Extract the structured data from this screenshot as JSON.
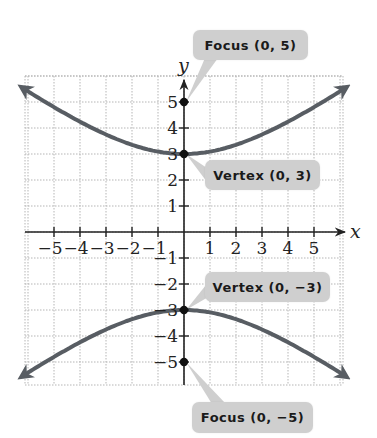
{
  "chart_data": {
    "type": "line",
    "title": "",
    "xlabel": "x",
    "ylabel": "y",
    "xlim": [
      -6.2,
      6.2
    ],
    "ylim": [
      -6,
      6
    ],
    "grid": true,
    "equation": "y^2/9 - x^2/16 = 1",
    "x_ticks": [
      -5,
      -4,
      -3,
      -2,
      -1,
      1,
      2,
      3,
      4,
      5
    ],
    "y_ticks": [
      -5,
      -4,
      -3,
      -2,
      -1,
      1,
      2,
      3,
      4,
      5
    ],
    "series": [
      {
        "name": "upper branch",
        "x": [
          -6.2,
          -4,
          -2,
          0,
          2,
          4,
          6.2
        ],
        "y": [
          5.53,
          4.24,
          3.35,
          3,
          3.35,
          4.24,
          5.53
        ]
      },
      {
        "name": "lower branch",
        "x": [
          -6.2,
          -4,
          -2,
          0,
          2,
          4,
          6.2
        ],
        "y": [
          -5.53,
          -4.24,
          -3.35,
          -3,
          -3.35,
          -4.24,
          -5.53
        ]
      }
    ],
    "points": [
      {
        "label": "Focus (0, 5)",
        "x": 0,
        "y": 5
      },
      {
        "label": "Vertex (0, 3)",
        "x": 0,
        "y": 3
      },
      {
        "label": "Vertex (0, −3)",
        "x": 0,
        "y": -3
      },
      {
        "label": "Focus (0, −5)",
        "x": 0,
        "y": -5
      }
    ],
    "annotations": [
      "Focus (0, 5)",
      "Vertex (0, 3)",
      "Vertex (0, −3)",
      "Focus (0, −5)"
    ]
  },
  "labels": {
    "x_axis": "x",
    "y_axis": "y",
    "focus_top": "Focus (0, 5)",
    "vertex_top": "Vertex (0, 3)",
    "vertex_bottom": "Vertex (0, −3)",
    "focus_bottom": "Focus (0, −5)"
  },
  "colors": {
    "curve": "#585d63",
    "callout_bg": "#cfcfcf",
    "grid": "#b5b5b5",
    "axis": "#222222"
  }
}
